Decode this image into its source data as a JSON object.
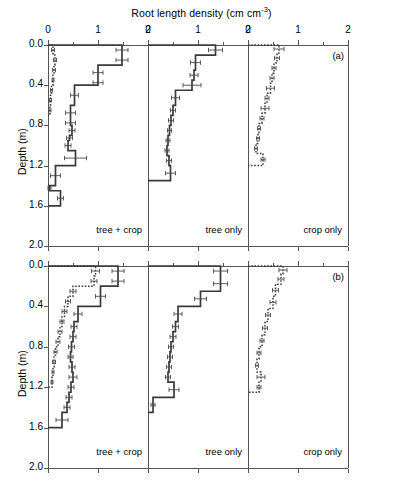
{
  "chart_data": {
    "type": "line",
    "title": "Root length density (cm cm-3)",
    "title_main": "Root length density (cm cm",
    "title_sup": "-3",
    "title_tail": ")",
    "xlabel": "Root length density (cm cm^-3)",
    "ylabel": "Depth (m)",
    "xlim": [
      0,
      2
    ],
    "ylim": [
      0,
      2
    ],
    "xticks": [
      0,
      1,
      2
    ],
    "xticklabels": [
      "0",
      "1",
      "2"
    ],
    "yticks": [
      0.0,
      0.4,
      0.8,
      1.2,
      1.6,
      2.0
    ],
    "yticklabels": [
      "0.0",
      "0.4",
      "0.8",
      "1.2",
      "1.6",
      "2.0"
    ],
    "grid": false,
    "legend_position": "none",
    "orientation": "horizontal-profile",
    "axis_top": true,
    "panel_column_labels": [
      "tree + crop",
      "tree only",
      "crop only"
    ],
    "panel_row_tags": [
      "(a)",
      "(b)"
    ],
    "series_styles": {
      "solid": "tree roots (solid)",
      "dotted": "crop roots (dotted)"
    },
    "panels": [
      {
        "row_tag": "(a)",
        "column_label": "tree + crop",
        "series": [
          {
            "name": "tree + crop solid",
            "style": "solid",
            "depth_edges": [
              0.0,
              0.1,
              0.2,
              0.35,
              0.4,
              0.6,
              0.75,
              0.8,
              0.9,
              0.95,
              1.05,
              1.2,
              1.4,
              1.45,
              1.6
            ],
            "values": [
              1.48,
              1.48,
              1.0,
              1.0,
              0.53,
              0.45,
              0.45,
              0.48,
              0.43,
              0.4,
              0.55,
              0.15,
              0.03,
              0.25
            ],
            "errors": [
              0.12,
              0.12,
              0.1,
              0.1,
              0.08,
              0.1,
              0.1,
              0.06,
              0.06,
              0.06,
              0.22,
              0.1,
              0.03,
              0.06
            ]
          },
          {
            "name": "tree + crop dotted",
            "style": "dotted",
            "depth_edges": [
              0.0,
              0.1,
              0.2,
              0.3,
              0.4,
              0.5,
              0.6,
              0.7
            ],
            "values": [
              0.1,
              0.14,
              0.12,
              0.1,
              0.07,
              0.05,
              0.04
            ],
            "errors": [
              0.03,
              0.03,
              0.03,
              0.02,
              0.02,
              0.02,
              0.02
            ]
          }
        ]
      },
      {
        "row_tag": "(a)",
        "column_label": "tree only",
        "series": [
          {
            "name": "tree only solid",
            "style": "solid",
            "depth_edges": [
              0.0,
              0.1,
              0.25,
              0.35,
              0.45,
              0.6,
              0.7,
              0.8,
              0.9,
              1.0,
              1.1,
              1.2,
              1.35
            ],
            "values": [
              1.35,
              0.95,
              0.92,
              0.88,
              0.55,
              0.5,
              0.46,
              0.43,
              0.4,
              0.38,
              0.42,
              0.45
            ],
            "errors": [
              0.14,
              0.1,
              0.08,
              0.18,
              0.08,
              0.05,
              0.05,
              0.04,
              0.04,
              0.04,
              0.05,
              0.1
            ]
          }
        ]
      },
      {
        "row_tag": "(a)",
        "column_label": "crop only",
        "series": [
          {
            "name": "crop only dotted",
            "style": "dotted",
            "depth_edges": [
              0.0,
              0.08,
              0.18,
              0.28,
              0.38,
              0.48,
              0.58,
              0.68,
              0.78,
              0.88,
              0.98,
              1.08,
              1.2
            ],
            "values": [
              0.62,
              0.58,
              0.52,
              0.48,
              0.45,
              0.38,
              0.34,
              0.28,
              0.22,
              0.2,
              0.16,
              0.3
            ],
            "errors": [
              0.1,
              0.05,
              0.04,
              0.04,
              0.08,
              0.04,
              0.08,
              0.04,
              0.03,
              0.03,
              0.03,
              0.04
            ]
          }
        ]
      },
      {
        "row_tag": "(b)",
        "column_label": "tree + crop",
        "series": [
          {
            "name": "tree + crop solid",
            "style": "solid",
            "depth_edges": [
              0.0,
              0.1,
              0.2,
              0.4,
              0.55,
              0.65,
              0.75,
              0.85,
              0.95,
              1.05,
              1.15,
              1.25,
              1.35,
              1.45,
              1.6
            ],
            "values": [
              1.4,
              1.4,
              1.05,
              0.6,
              0.52,
              0.5,
              0.47,
              0.45,
              0.48,
              0.5,
              0.46,
              0.42,
              0.38,
              0.28
            ],
            "errors": [
              0.12,
              0.12,
              0.1,
              0.08,
              0.06,
              0.06,
              0.06,
              0.05,
              0.06,
              0.08,
              0.06,
              0.06,
              0.06,
              0.12
            ]
          },
          {
            "name": "tree + crop dotted",
            "style": "dotted",
            "depth_edges": [
              0.0,
              0.1,
              0.2,
              0.3,
              0.4,
              0.5,
              0.6,
              0.7,
              0.8,
              0.9,
              1.0,
              1.1,
              1.2
            ],
            "values": [
              0.95,
              0.92,
              0.5,
              0.4,
              0.33,
              0.28,
              0.24,
              0.2,
              0.15,
              0.12,
              0.1,
              0.08
            ],
            "errors": [
              0.08,
              0.06,
              0.06,
              0.05,
              0.05,
              0.04,
              0.04,
              0.04,
              0.03,
              0.03,
              0.02,
              0.02
            ]
          }
        ]
      },
      {
        "row_tag": "(b)",
        "column_label": "tree only",
        "series": [
          {
            "name": "tree only solid",
            "style": "solid",
            "depth_edges": [
              0.0,
              0.1,
              0.25,
              0.4,
              0.55,
              0.65,
              0.75,
              0.85,
              0.95,
              1.05,
              1.15,
              1.3,
              1.45
            ],
            "values": [
              1.45,
              1.45,
              1.05,
              0.6,
              0.55,
              0.5,
              0.46,
              0.44,
              0.42,
              0.4,
              0.52,
              0.1
            ],
            "errors": [
              0.14,
              0.14,
              0.12,
              0.08,
              0.06,
              0.06,
              0.05,
              0.05,
              0.05,
              0.05,
              0.1,
              0.04
            ]
          }
        ]
      },
      {
        "row_tag": "(b)",
        "column_label": "crop only",
        "series": [
          {
            "name": "crop only dotted",
            "style": "dotted",
            "depth_edges": [
              0.0,
              0.08,
              0.18,
              0.3,
              0.42,
              0.55,
              0.68,
              0.8,
              0.92,
              1.05,
              1.15,
              1.25
            ],
            "values": [
              0.7,
              0.66,
              0.55,
              0.5,
              0.4,
              0.34,
              0.28,
              0.22,
              0.18,
              0.26,
              0.22
            ],
            "errors": [
              0.08,
              0.06,
              0.06,
              0.06,
              0.05,
              0.05,
              0.04,
              0.04,
              0.03,
              0.08,
              0.04
            ]
          }
        ]
      }
    ]
  }
}
